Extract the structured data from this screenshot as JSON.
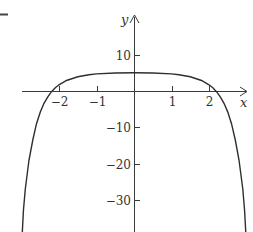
{
  "chart_data": {
    "type": "line",
    "title": "",
    "xlabel": "x",
    "ylabel": "y",
    "xlim": [
      -3.0,
      3.05
    ],
    "ylim": [
      -39,
      14
    ],
    "grid": false,
    "legend": null,
    "x_ticks": [
      {
        "value": -2,
        "label": "−2"
      },
      {
        "value": -1,
        "label": "−1"
      },
      {
        "value": 1,
        "label": "1"
      },
      {
        "value": 2,
        "label": "2"
      }
    ],
    "y_ticks": [
      {
        "value": 10,
        "label": "10"
      },
      {
        "value": -10,
        "label": "−10"
      },
      {
        "value": -20,
        "label": "−20"
      },
      {
        "value": -30,
        "label": "−30"
      }
    ],
    "series": [
      {
        "name": "curve",
        "x": [
          -2.98,
          -2.95,
          -2.9,
          -2.8,
          -2.7,
          -2.6,
          -2.5,
          -2.4,
          -2.3,
          -2.2,
          -2.1,
          -2.0,
          -1.8,
          -1.5,
          -1.2,
          -1.0,
          -0.5,
          0,
          0.5,
          1.0,
          1.2,
          1.5,
          1.8,
          2.0,
          2.1,
          2.2,
          2.3,
          2.4,
          2.5,
          2.6,
          2.7,
          2.8,
          2.9,
          2.95,
          2.98
        ],
        "y": [
          -39,
          -33,
          -27,
          -19,
          -13.5,
          -9,
          -5.8,
          -3.4,
          -1.6,
          -0.2,
          0.9,
          1.7,
          2.9,
          3.9,
          4.5,
          4.7,
          4.95,
          5.0,
          4.95,
          4.7,
          4.5,
          3.9,
          2.9,
          1.7,
          0.9,
          -0.2,
          -1.6,
          -3.4,
          -5.8,
          -9,
          -13.5,
          -19,
          -27,
          -33,
          -39
        ]
      }
    ]
  },
  "layout": {
    "origin_px": [
      134,
      91
    ],
    "x_scale_px_per_unit": 37.5,
    "y_scale_px_per_unit": 3.63
  }
}
